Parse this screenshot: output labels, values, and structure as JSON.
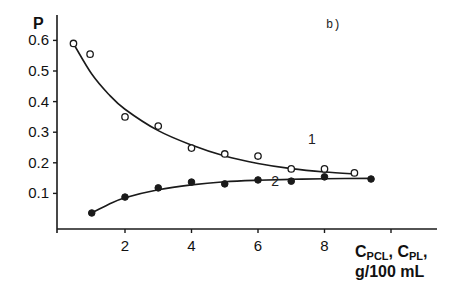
{
  "chart_data": {
    "type": "scatter",
    "title": "",
    "panel_label": "b)",
    "xlabel": "C_PCL, C_PL, g/100 mL",
    "xlabel_line1_parts": [
      {
        "text": "C",
        "sub": false
      },
      {
        "text": "PCL",
        "sub": true
      },
      {
        "text": ", C",
        "sub": false
      },
      {
        "text": "PL",
        "sub": true
      },
      {
        "text": ",",
        "sub": false
      }
    ],
    "xlabel_line2": "g/100 mL",
    "ylabel": "P",
    "xlim": [
      0,
      11.5
    ],
    "ylim": [
      0,
      0.68
    ],
    "xticks": [
      2,
      4,
      6,
      8,
      10
    ],
    "xtick_labels": [
      "2",
      "4",
      "6",
      "8",
      ""
    ],
    "yticks": [
      0.1,
      0.2,
      0.3,
      0.4,
      0.5,
      0.6
    ],
    "ytick_labels": [
      "0.1",
      "0.2",
      "0.3",
      "0.4",
      "0.5",
      "0.6"
    ],
    "grid": false,
    "legend": "inline curve labels",
    "series": [
      {
        "name": "1",
        "marker": "open-circle",
        "label_pos": [
          7.5,
          0.26
        ],
        "x": [
          0.45,
          0.95,
          2,
          3,
          4,
          5,
          6,
          7,
          8,
          8.9
        ],
        "y": [
          0.59,
          0.555,
          0.35,
          0.32,
          0.248,
          0.229,
          0.222,
          0.18,
          0.18,
          0.167
        ],
        "fit": {
          "x": [
            0.5,
            1,
            1.5,
            2,
            3,
            4,
            5,
            6,
            7,
            8,
            9
          ],
          "y": [
            0.58,
            0.49,
            0.425,
            0.375,
            0.305,
            0.258,
            0.222,
            0.198,
            0.181,
            0.17,
            0.163
          ]
        }
      },
      {
        "name": "2",
        "marker": "filled-circle",
        "label_pos": [
          6.4,
          0.125
        ],
        "x": [
          1,
          2,
          3,
          4,
          5,
          6,
          7,
          8,
          9.4
        ],
        "y": [
          0.036,
          0.088,
          0.118,
          0.137,
          0.131,
          0.144,
          0.14,
          0.154,
          0.147
        ],
        "fit": {
          "x": [
            1,
            1.5,
            2,
            3,
            4,
            5,
            6,
            7,
            8,
            9.4
          ],
          "y": [
            0.036,
            0.064,
            0.086,
            0.112,
            0.128,
            0.138,
            0.143,
            0.146,
            0.148,
            0.149
          ]
        }
      }
    ]
  },
  "layout": {
    "origin_px": [
      58.5,
      224
    ],
    "px_per_x": 33.25,
    "px_per_y": 306,
    "x_axis_end_px": 437,
    "y_axis_top_px": 15,
    "x_axis_y_px": 229,
    "line_color": "#1a1a1a"
  }
}
